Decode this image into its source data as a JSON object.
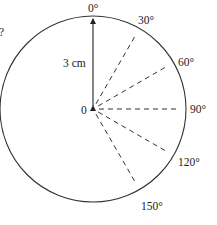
{
  "diagram": {
    "question_fragment": "?",
    "radius_label": "3 cm",
    "center_label": "0",
    "angles": [
      {
        "deg": 0,
        "label": "0°"
      },
      {
        "deg": 30,
        "label": "30°"
      },
      {
        "deg": 60,
        "label": "60°"
      },
      {
        "deg": 90,
        "label": "90°"
      },
      {
        "deg": 120,
        "label": "120°"
      },
      {
        "deg": 150,
        "label": "150°"
      }
    ],
    "colors": {
      "stroke": "#333333",
      "text": "#222222",
      "background": "#ffffff"
    }
  }
}
